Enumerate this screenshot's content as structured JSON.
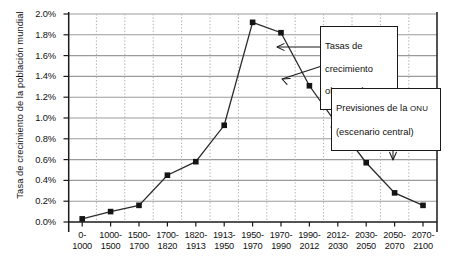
{
  "figure": {
    "background": "#ffffff",
    "ylabel": "Tasa de crecimiento de la población mundial"
  },
  "axes": {
    "y_ticks": [
      "0.0%",
      "0.2%",
      "0.4%",
      "0.6%",
      "0.8%",
      "1.0%",
      "1.2%",
      "1.4%",
      "1.6%",
      "1.8%",
      "2.0%"
    ],
    "x_ticks": [
      "0-\n1000",
      "1000-\n1500",
      "1500-\n1700",
      "1700-\n1820",
      "1820-\n1913",
      "1913-\n1950",
      "1950-\n1970",
      "1970-\n1990",
      "1990-\n2012",
      "2012-\n2030",
      "2030-\n2050",
      "2050-\n2070",
      "2070-\n2100"
    ],
    "grid_color": "#9b9b9b",
    "vgrid_color": "#b5b5b5",
    "axis_color": "#1a1a1a"
  },
  "annotations": {
    "observed": {
      "line1": "Tasas de",
      "line2": "crecimiento",
      "line3": "observadas"
    },
    "forecast": {
      "line1_a": "Previsiones de la ",
      "line1_b": "ONU",
      "line2": "(escenario central)"
    }
  },
  "chart_data": {
    "type": "line",
    "title": "",
    "xlabel": "",
    "ylabel": "Tasa de crecimiento de la población mundial",
    "ylim": [
      0.0,
      2.0
    ],
    "yunit": "%",
    "grid": true,
    "legend": "none",
    "marker": "square",
    "marker_color": "#141414",
    "line_color": "#2b2b2b",
    "categories": [
      "0-1000",
      "1000-1500",
      "1500-1700",
      "1700-1820",
      "1820-1913",
      "1913-1950",
      "1950-1970",
      "1970-1990",
      "1990-2012",
      "2012-2030",
      "2030-2050",
      "2050-2070",
      "2070-2100"
    ],
    "values": [
      0.03,
      0.1,
      0.16,
      0.45,
      0.58,
      0.93,
      1.92,
      1.82,
      1.31,
      0.93,
      0.57,
      0.28,
      0.16
    ],
    "annotations": [
      {
        "text": "Tasas de crecimiento observadas",
        "points_to": "observed-series-segment"
      },
      {
        "text": "Previsiones de la ONU (escenario central)",
        "points_to": "forecast-series-segment"
      }
    ],
    "observed_range": [
      "0-1000",
      "1990-2012"
    ],
    "forecast_range": [
      "2012-2030",
      "2070-2100"
    ]
  }
}
